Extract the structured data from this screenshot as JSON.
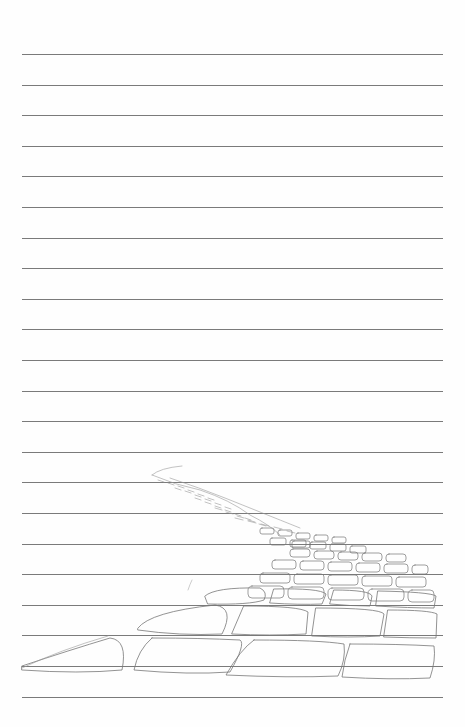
{
  "page": {
    "type": "lined-paper",
    "line_count": 22,
    "first_line_y": 54,
    "line_spacing": 30.6,
    "line_left": 22,
    "line_width": 421,
    "line_color": "#7a7a7a",
    "background": "#fefefe"
  },
  "illustration": {
    "subject": "cobblestone-road-sketch",
    "stroke_color": "#777777"
  }
}
